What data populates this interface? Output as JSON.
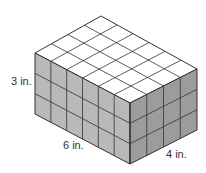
{
  "figure": {
    "type": "rectangular prism made of unit cubes",
    "dimensions": {
      "length": 6,
      "width": 4,
      "height": 3,
      "unit": "in."
    },
    "labels": {
      "height": "3 in.",
      "length": "6 in.",
      "width": "4 in."
    },
    "colors": {
      "top_face": "#ffffff",
      "front_face": "#b9b9b9",
      "side_face": "#9c9c9c",
      "grid_lines": "#333333",
      "label_text": "#333333"
    }
  }
}
